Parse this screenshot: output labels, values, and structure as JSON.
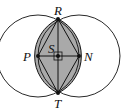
{
  "diagram": {
    "type": "geometry",
    "colors": {
      "stroke": "#111111",
      "shade": "#a9a9a9",
      "background": "#ffffff"
    },
    "points": {
      "R": {
        "label": "R",
        "x": 58,
        "y": 19
      },
      "T": {
        "label": "T",
        "x": 58,
        "y": 93
      },
      "P": {
        "label": "P",
        "x": 38,
        "y": 56
      },
      "N": {
        "label": "N",
        "x": 79,
        "y": 56
      },
      "S": {
        "label": "S",
        "x": 58,
        "y": 56
      }
    },
    "circles": [
      {
        "center": "P",
        "radius": 41
      },
      {
        "center": "N",
        "radius": 41
      }
    ],
    "segments": [
      "PR",
      "RN",
      "NT",
      "TP",
      "RT",
      "PN"
    ],
    "right_angle_at": "S"
  }
}
